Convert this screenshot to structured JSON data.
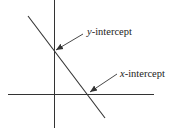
{
  "diagram": {
    "type": "coordinate-axes-with-line",
    "labels": {
      "y_intercept": {
        "variable": "y",
        "suffix": "-intercept"
      },
      "x_intercept": {
        "variable": "x",
        "suffix": "-intercept"
      }
    },
    "colors": {
      "stroke": "#333333",
      "background": "#ffffff"
    }
  }
}
